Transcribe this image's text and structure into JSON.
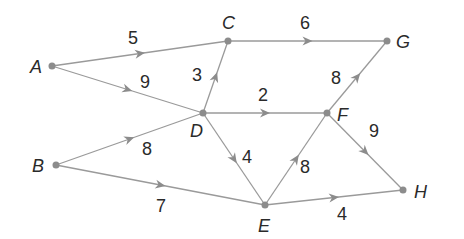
{
  "diagram": {
    "type": "weighted-directed-graph",
    "colors": {
      "edge": "#9a9a9a",
      "node": "#8c8c8c",
      "text": "#2a2a2a",
      "background": "#ffffff"
    },
    "nodes": [
      {
        "id": "A",
        "label": "A",
        "x": 52,
        "y": 66,
        "lx": 30,
        "ly": 73
      },
      {
        "id": "B",
        "label": "B",
        "x": 56,
        "y": 165,
        "lx": 32,
        "ly": 172
      },
      {
        "id": "C",
        "label": "C",
        "x": 228,
        "y": 41,
        "lx": 222,
        "ly": 29
      },
      {
        "id": "D",
        "label": "D",
        "x": 203,
        "y": 113,
        "lx": 190,
        "ly": 137
      },
      {
        "id": "E",
        "label": "E",
        "x": 265,
        "y": 205,
        "lx": 258,
        "ly": 232
      },
      {
        "id": "F",
        "label": "F",
        "x": 327,
        "y": 113,
        "lx": 337,
        "ly": 121
      },
      {
        "id": "G",
        "label": "G",
        "x": 387,
        "y": 41,
        "lx": 396,
        "ly": 48
      },
      {
        "id": "H",
        "label": "H",
        "x": 403,
        "y": 190,
        "lx": 414,
        "ly": 198
      }
    ],
    "edges": [
      {
        "from": "A",
        "to": "C",
        "weight": "5",
        "wx": 128,
        "wy": 44
      },
      {
        "from": "A",
        "to": "D",
        "weight": "9",
        "wx": 140,
        "wy": 88
      },
      {
        "from": "D",
        "to": "C",
        "weight": "3",
        "wx": 192,
        "wy": 81
      },
      {
        "from": "C",
        "to": "G",
        "weight": "6",
        "wx": 300,
        "wy": 29
      },
      {
        "from": "D",
        "to": "F",
        "weight": "2",
        "wx": 258,
        "wy": 101
      },
      {
        "from": "F",
        "to": "G",
        "weight": "8",
        "wx": 331,
        "wy": 84
      },
      {
        "from": "B",
        "to": "D",
        "weight": "8",
        "wx": 142,
        "wy": 155
      },
      {
        "from": "D",
        "to": "E",
        "weight": "4",
        "wx": 242,
        "wy": 163
      },
      {
        "from": "E",
        "to": "F",
        "weight": "8",
        "wx": 300,
        "wy": 173
      },
      {
        "from": "F",
        "to": "H",
        "weight": "9",
        "wx": 369,
        "wy": 137
      },
      {
        "from": "B",
        "to": "E",
        "weight": "7",
        "wx": 156,
        "wy": 212
      },
      {
        "from": "E",
        "to": "H",
        "weight": "4",
        "wx": 337,
        "wy": 220
      }
    ]
  }
}
